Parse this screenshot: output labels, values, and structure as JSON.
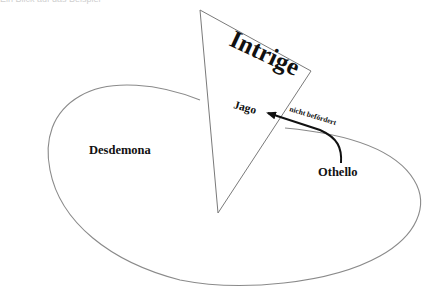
{
  "caption": "Ein Blick auf das Beispiel",
  "diagram": {
    "triangle_label": "Intrige",
    "nodes": {
      "jago": "Jago",
      "desdemona": "Desdemona",
      "othello": "Othello"
    },
    "arrow_label": "nicht befördert",
    "colors": {
      "outline": "#8a8a8a",
      "text": "#111111",
      "arrow": "#111111",
      "background": "#ffffff"
    }
  }
}
